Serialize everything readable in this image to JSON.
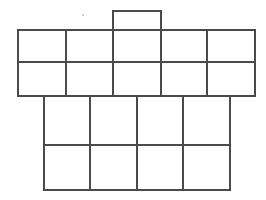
{
  "figure": {
    "title": "",
    "caption": "",
    "background_color": "#ffffff",
    "stroke_color": "#4a4a4a",
    "fill_color": "#ffffff",
    "stroke_width": 1.5,
    "canvas": {
      "width": 266,
      "height": 200
    }
  },
  "chart_data": {
    "type": "diagram",
    "title": "",
    "xlabel": "",
    "ylabel": "",
    "grid": false,
    "legend": "none",
    "groups": [
      {
        "name": "top-tab",
        "label": "",
        "rows": 1,
        "cols": 1,
        "x0": 113,
        "y0": 11,
        "x1": 161,
        "y1": 33,
        "x_edges": [
          113,
          161
        ],
        "y_edges": [
          11,
          33
        ]
      },
      {
        "name": "upper-band",
        "label": "",
        "rows": 2,
        "cols": 5,
        "x0": 18,
        "y0": 30,
        "x1": 255,
        "y1": 96,
        "x_edges": [
          18,
          66,
          113,
          161,
          207,
          255
        ],
        "y_edges": [
          30,
          62,
          96
        ]
      },
      {
        "name": "lower-band",
        "label": "",
        "rows": 2,
        "cols": 4,
        "x0": 44,
        "y0": 96,
        "x1": 230,
        "y1": 190,
        "x_edges": [
          44,
          90,
          137,
          183,
          230
        ],
        "y_edges": [
          96,
          145,
          190
        ]
      }
    ],
    "marks": [
      {
        "name": "speck",
        "x": 83,
        "y": 15,
        "r": 1.4
      }
    ],
    "cell_count_total": 22
  }
}
